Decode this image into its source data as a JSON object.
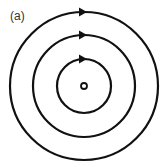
{
  "figure": {
    "label": "(a)",
    "center": [
      84,
      86
    ],
    "source_radius": 3,
    "field_lines": [
      {
        "radius": 27,
        "direction": "clockwise"
      },
      {
        "radius": 51,
        "direction": "clockwise"
      },
      {
        "radius": 74,
        "direction": "clockwise"
      }
    ],
    "stroke_color": "#111111"
  }
}
